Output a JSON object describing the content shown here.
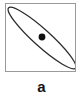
{
  "figure": {
    "panel_label": "a",
    "panel_type": "schematic-diagram",
    "background_color": "#ffffff",
    "frame": {
      "name": "panel-border",
      "stroke_color": "#9a9a9a",
      "stroke_width_px": 1.4,
      "fill_color": "#ffffff",
      "x_px": 5,
      "y_px": 3,
      "width_px": 71,
      "height_px": 69
    },
    "shapes": [
      {
        "name": "ellipse-outline",
        "type": "ellipse",
        "center_x_px": 36,
        "center_y_px": 34,
        "semi_major_px": 45,
        "semi_minor_px": 8.5,
        "rotation_deg": 42,
        "stroke_color": "#2b2b2b",
        "stroke_width_px": 1.3,
        "fill": "none"
      },
      {
        "name": "center-dot",
        "type": "circle",
        "center_x_px": 36,
        "center_y_px": 33,
        "radius_px": 3.4,
        "fill_color": "#101010",
        "stroke": "none"
      }
    ]
  }
}
